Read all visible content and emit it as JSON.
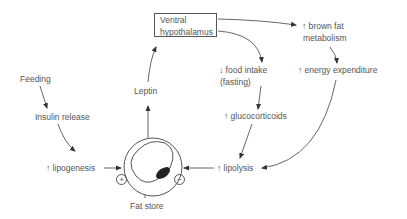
{
  "diagram": {
    "title": "",
    "nodes": {
      "hypothalamus": {
        "line1": "Ventral",
        "line2": "hypothalamus"
      },
      "brown_fat": {
        "line1": "↑ brown fat",
        "line2": "metabolism"
      },
      "energy_expenditure": "↑ energy expenditure",
      "food_intake": {
        "line1": "↓ food intake",
        "line2": "(fasting)"
      },
      "glucocorticoids": "↑ glucocorticoids",
      "lipolysis": "↑ lipolysis",
      "feeding": "Feeding",
      "insulin_release": "Insulin release",
      "lipogenesis": "↑ lipogenesis",
      "leptin": "Leptin",
      "fat_store": "Fat store",
      "plus_sign": "+",
      "minus_sign": "−"
    },
    "edges": [
      [
        "Feeding",
        "Insulin release"
      ],
      [
        "Insulin release",
        "↑ lipogenesis"
      ],
      [
        "↑ lipogenesis",
        "Fat cell (+)"
      ],
      [
        "Fat cell",
        "Leptin"
      ],
      [
        "Leptin",
        "Ventral hypothalamus"
      ],
      [
        "Ventral hypothalamus",
        "↑ brown fat metabolism"
      ],
      [
        "↑ brown fat metabolism",
        "↑ energy expenditure"
      ],
      [
        "↑ energy expenditure",
        "↑ lipolysis"
      ],
      [
        "Ventral hypothalamus",
        "↓ food intake (fasting)"
      ],
      [
        "↓ food intake (fasting)",
        "↑ glucocorticoids"
      ],
      [
        "↑ glucocorticoids",
        "↑ lipolysis"
      ],
      [
        "↑ lipolysis",
        "Fat cell (−)"
      ]
    ]
  }
}
